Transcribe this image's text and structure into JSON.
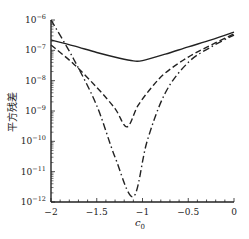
{
  "chart_data": {
    "type": "line",
    "title": "",
    "xlabel": "c0",
    "ylabel": "平方残差",
    "xlim": [
      -2,
      0
    ],
    "ylim": [
      1e-12,
      1e-06
    ],
    "yscale": "log",
    "grid": false,
    "legend": null,
    "x_ticks": [
      "-2",
      "-1.5",
      "-1",
      "-0.5",
      "0"
    ],
    "y_ticks": [
      "10^-12",
      "10^-11",
      "10^-10",
      "10^-9",
      "10^-8",
      "10^-7",
      "10^-6"
    ],
    "series": [
      {
        "name": "solid",
        "style": "solid",
        "x": [
          -2.0,
          -1.75,
          -1.5,
          -1.25,
          -1.1,
          -1.0,
          -0.75,
          -0.5,
          -0.25,
          0.0
        ],
        "values": [
          2.2e-07,
          1.4e-07,
          8.5e-08,
          5.5e-08,
          4.5e-08,
          4.6e-08,
          7.5e-08,
          1.3e-07,
          2.2e-07,
          4e-07
        ]
      },
      {
        "name": "dashed",
        "style": "dashed",
        "x": [
          -2.0,
          -1.75,
          -1.5,
          -1.3,
          -1.17,
          -1.05,
          -0.9,
          -0.75,
          -0.5,
          -0.25,
          0.0
        ],
        "values": [
          1.5e-07,
          3.5e-08,
          6e-09,
          1.2e-09,
          3e-10,
          1.5e-09,
          6e-09,
          1.8e-08,
          6e-08,
          1.5e-07,
          3.5e-07
        ]
      },
      {
        "name": "dash-dot",
        "style": "dashdot",
        "x": [
          -2.0,
          -1.75,
          -1.5,
          -1.3,
          -1.1,
          -0.95,
          -0.75,
          -0.5,
          -0.25,
          0.0
        ],
        "values": [
          1e-06,
          5e-08,
          1.5e-09,
          3e-11,
          1.5e-12,
          1e-10,
          4e-09,
          4e-08,
          1.3e-07,
          3.2e-07
        ]
      }
    ]
  }
}
